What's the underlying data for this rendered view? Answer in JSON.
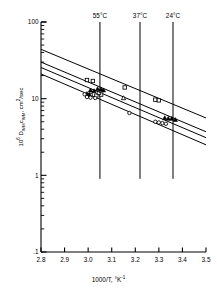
{
  "chart_data": {
    "type": "scatter",
    "title": "",
    "subtitle": "",
    "xlabel": "1000/T, °K⁻¹",
    "ylabel": "10⁶ DWMcWM, cm²/sec",
    "ylabel_parts": {
      "prefix": "10",
      "exponent": "6",
      "d_symbol": "D",
      "d_sub": "WM",
      "c_symbol": "c",
      "c_sub": "WM",
      "units": ", cm",
      "units_exp": "2",
      "units_tail": "/sec"
    },
    "xlabel_parts": {
      "main": "1000/T, °K",
      "exponent": "-1"
    },
    "xlim": [
      2.8,
      3.5
    ],
    "ylim": [
      0.1,
      100
    ],
    "yscale": "log",
    "xscale": "linear",
    "grid": false,
    "legend": "none",
    "xticks": [
      2.8,
      2.9,
      3.0,
      3.1,
      3.2,
      3.3,
      3.4,
      3.5
    ],
    "xticklabels": [
      "2.8",
      "2.9",
      "3.0",
      "3.1",
      "3.2",
      "3.3",
      "3.4",
      "3.5"
    ],
    "yticks": [
      0.1,
      1,
      10,
      100
    ],
    "yticklabels": [
      ".1",
      "1",
      "10",
      "100"
    ],
    "y_minor_ticks": [
      0.2,
      0.3,
      0.4,
      0.5,
      0.6,
      0.7,
      0.8,
      0.9,
      2,
      3,
      4,
      5,
      6,
      7,
      8,
      9,
      20,
      30,
      40,
      50,
      60,
      70,
      80,
      90
    ],
    "annotations": [
      {
        "label": "55°C",
        "x": 3.05,
        "type": "vline",
        "y_top": 100,
        "y_bottom": 0.9
      },
      {
        "label": "37°C",
        "x": 3.22,
        "type": "vline",
        "y_top": 100,
        "y_bottom": 0.9
      },
      {
        "label": "24°C",
        "x": 3.36,
        "type": "vline",
        "y_top": 100,
        "y_bottom": 0.9
      }
    ],
    "fit_lines": [
      {
        "name": "line-1-upper",
        "x": [
          2.8,
          3.5
        ],
        "y": [
          44.0,
          5.6
        ],
        "color": "#000000"
      },
      {
        "name": "line-2",
        "x": [
          2.8,
          3.5
        ],
        "y": [
          30.0,
          3.7
        ],
        "color": "#000000"
      },
      {
        "name": "line-3",
        "x": [
          2.8,
          3.5
        ],
        "y": [
          25.5,
          3.1
        ],
        "color": "#000000"
      },
      {
        "name": "line-4-lower",
        "x": [
          2.8,
          3.5
        ],
        "y": [
          21.0,
          2.5
        ],
        "color": "#000000"
      }
    ],
    "series": [
      {
        "name": "open-square",
        "marker": "square-open",
        "color": "#000000",
        "points": [
          {
            "x": 2.995,
            "y": 17.5
          },
          {
            "x": 3.02,
            "y": 17.0
          },
          {
            "x": 3.01,
            "y": 11.2
          },
          {
            "x": 3.035,
            "y": 11.0
          },
          {
            "x": 3.055,
            "y": 11.3
          },
          {
            "x": 3.155,
            "y": 14.0
          },
          {
            "x": 3.285,
            "y": 9.7
          },
          {
            "x": 3.3,
            "y": 9.5
          }
        ]
      },
      {
        "name": "filled-triangle",
        "marker": "triangle-filled",
        "color": "#000000",
        "points": [
          {
            "x": 3.01,
            "y": 12.9
          },
          {
            "x": 3.025,
            "y": 12.6
          },
          {
            "x": 3.04,
            "y": 13.4
          },
          {
            "x": 3.055,
            "y": 13.2
          },
          {
            "x": 3.065,
            "y": 12.9
          },
          {
            "x": 2.995,
            "y": 11.6
          },
          {
            "x": 3.005,
            "y": 11.3
          },
          {
            "x": 3.325,
            "y": 5.6
          },
          {
            "x": 3.34,
            "y": 5.5
          },
          {
            "x": 3.355,
            "y": 5.5
          },
          {
            "x": 3.37,
            "y": 5.3
          }
        ]
      },
      {
        "name": "open-triangle",
        "marker": "triangle-open",
        "color": "#000000",
        "points": [
          {
            "x": 3.15,
            "y": 10.2
          },
          {
            "x": 3.045,
            "y": 11.9
          }
        ]
      },
      {
        "name": "open-circle",
        "marker": "circle-open",
        "color": "#000000",
        "points": [
          {
            "x": 2.985,
            "y": 11.4
          },
          {
            "x": 2.995,
            "y": 10.5
          },
          {
            "x": 3.01,
            "y": 10.3
          },
          {
            "x": 3.03,
            "y": 10.2
          },
          {
            "x": 3.175,
            "y": 6.5
          },
          {
            "x": 3.285,
            "y": 5.0
          },
          {
            "x": 3.3,
            "y": 4.9
          },
          {
            "x": 3.315,
            "y": 4.8
          },
          {
            "x": 3.33,
            "y": 4.7
          }
        ]
      }
    ]
  }
}
